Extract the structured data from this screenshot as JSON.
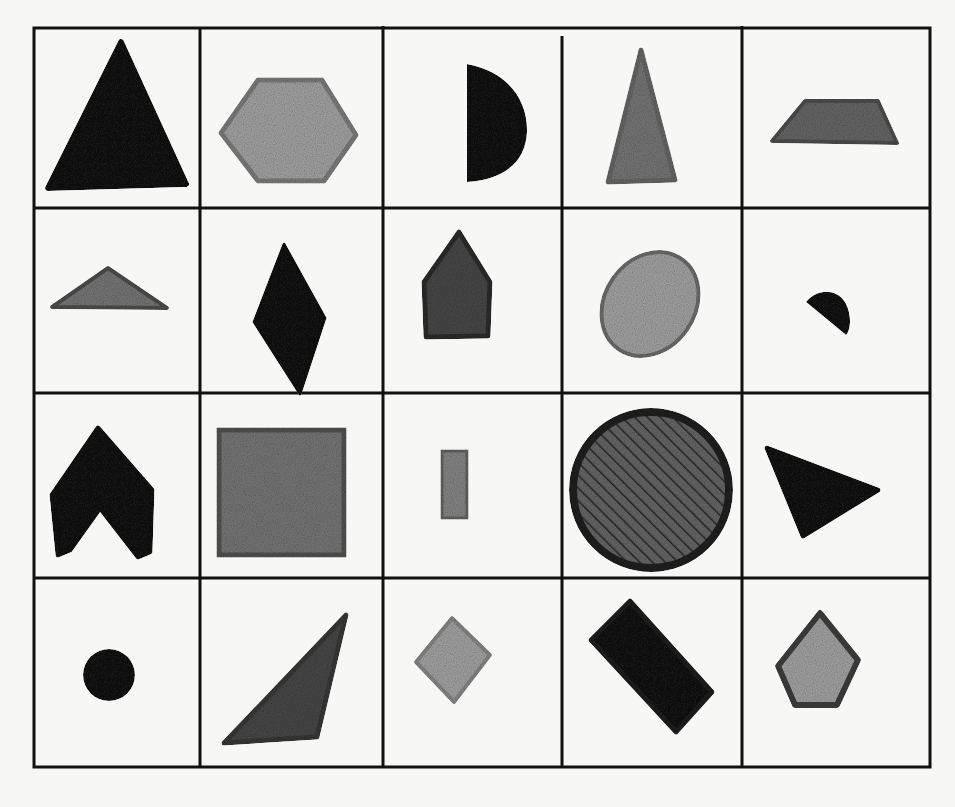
{
  "figure": {
    "type": "shape-grid",
    "rows": 4,
    "columns": 5,
    "grid_line_color": "#111111",
    "background_color": "#f7f7f5",
    "fill_colors": {
      "black": "#151515",
      "dark_gray": "#4a4a4a",
      "mid_gray": "#7a7a7a",
      "light_gray": "#a8a8a8"
    },
    "cells": [
      {
        "row": 1,
        "col": 1,
        "shape": "equilateral-triangle",
        "fill": "black"
      },
      {
        "row": 1,
        "col": 2,
        "shape": "hexagon",
        "fill": "light_gray"
      },
      {
        "row": 1,
        "col": 3,
        "shape": "semicircle",
        "fill": "black"
      },
      {
        "row": 1,
        "col": 4,
        "shape": "isosceles-triangle-tall",
        "fill": "mid_gray"
      },
      {
        "row": 1,
        "col": 5,
        "shape": "trapezoid",
        "fill": "mid_gray"
      },
      {
        "row": 2,
        "col": 1,
        "shape": "obtuse-triangle",
        "fill": "mid_gray"
      },
      {
        "row": 2,
        "col": 2,
        "shape": "rhombus",
        "fill": "black"
      },
      {
        "row": 2,
        "col": 3,
        "shape": "pentagon-house",
        "fill": "dark_gray"
      },
      {
        "row": 2,
        "col": 4,
        "shape": "ellipse",
        "fill": "light_gray"
      },
      {
        "row": 2,
        "col": 5,
        "shape": "small-semicircle",
        "fill": "black"
      },
      {
        "row": 3,
        "col": 1,
        "shape": "chevron",
        "fill": "black"
      },
      {
        "row": 3,
        "col": 2,
        "shape": "square",
        "fill": "mid_gray"
      },
      {
        "row": 3,
        "col": 3,
        "shape": "small-rectangle",
        "fill": "mid_gray"
      },
      {
        "row": 3,
        "col": 4,
        "shape": "circle-hatched",
        "fill": "dark_gray"
      },
      {
        "row": 3,
        "col": 5,
        "shape": "triangle-pointing-right",
        "fill": "black"
      },
      {
        "row": 4,
        "col": 1,
        "shape": "small-circle",
        "fill": "black"
      },
      {
        "row": 4,
        "col": 2,
        "shape": "scalene-triangle",
        "fill": "dark_gray"
      },
      {
        "row": 4,
        "col": 3,
        "shape": "small-diamond-square",
        "fill": "light_gray"
      },
      {
        "row": 4,
        "col": 4,
        "shape": "rotated-rectangle",
        "fill": "black"
      },
      {
        "row": 4,
        "col": 5,
        "shape": "pentagon",
        "fill": "light_gray"
      }
    ]
  }
}
